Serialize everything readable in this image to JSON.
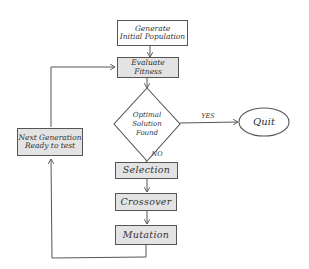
{
  "diagram": {
    "type": "flowchart",
    "nodes": {
      "generate": {
        "label": "Generate Initial Population",
        "line1": "Generate",
        "line2": "Initial Population",
        "shape": "rectangle"
      },
      "evaluate": {
        "label": "Evaluate Fitness",
        "line1": "Evaluate",
        "line2": "Fitness",
        "shape": "rectangle"
      },
      "decision": {
        "label": "Optimal Solution Found",
        "line1": "Optimal",
        "line2": "Solution",
        "line3": "Found",
        "shape": "diamond"
      },
      "quit": {
        "label": "Quit",
        "shape": "ellipse"
      },
      "selection": {
        "label": "Selection",
        "shape": "rectangle"
      },
      "crossover": {
        "label": "Crossover",
        "shape": "rectangle"
      },
      "mutation": {
        "label": "Mutation",
        "shape": "rectangle"
      },
      "next_gen": {
        "label": "Next Generation Ready to test",
        "line1": "Next Generation",
        "line2": "Ready to test",
        "shape": "rectangle"
      }
    },
    "edges": [
      {
        "from": "generate",
        "to": "evaluate",
        "label": ""
      },
      {
        "from": "evaluate",
        "to": "decision",
        "label": ""
      },
      {
        "from": "decision",
        "to": "quit",
        "label": "YES"
      },
      {
        "from": "decision",
        "to": "selection",
        "label": "NO"
      },
      {
        "from": "selection",
        "to": "crossover",
        "label": ""
      },
      {
        "from": "crossover",
        "to": "mutation",
        "label": ""
      },
      {
        "from": "mutation",
        "to": "next_gen",
        "label": ""
      },
      {
        "from": "next_gen",
        "to": "evaluate",
        "label": ""
      }
    ],
    "edge_labels": {
      "yes": "YES",
      "no": "NO"
    },
    "colors": {
      "stroke": "#555555",
      "shaded_fill": "#e3e3e3",
      "background": "#ffffff"
    }
  }
}
